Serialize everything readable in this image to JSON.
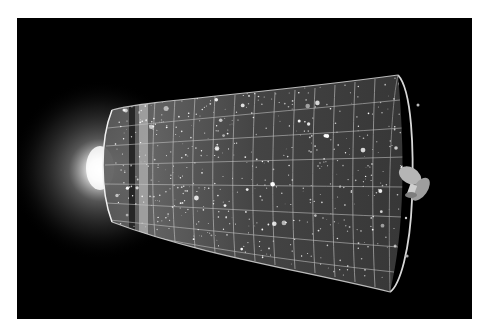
{
  "image": {
    "subject": "Illustration of the expanding universe timeline",
    "palette": {
      "background": "#000000",
      "page": "#ffffff",
      "glow": "#ffffff",
      "grid": "#bdbdbd",
      "surface": "#6a6a6a"
    },
    "elements": [
      {
        "name": "big-bang-glow",
        "center": [
          100,
          170
        ],
        "radius": 85
      },
      {
        "name": "expansion-cone",
        "left_cap_x": 110,
        "right_opening_x": 395
      },
      {
        "name": "cmb-dark-band",
        "x": 132
      },
      {
        "name": "cmb-bright-band",
        "x": 143
      },
      {
        "name": "satellite",
        "center": [
          415,
          183
        ]
      }
    ]
  }
}
